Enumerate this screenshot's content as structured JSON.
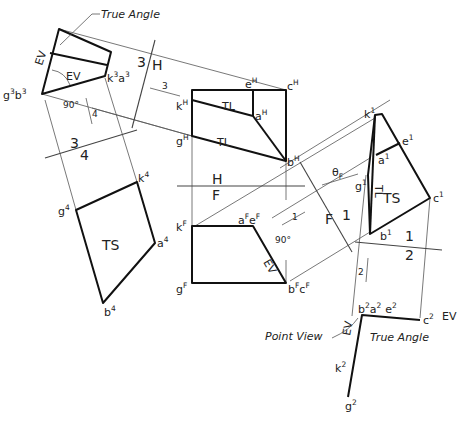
{
  "annotations": {
    "true_angle_top": "True Angle",
    "true_angle_bottom": "True Angle",
    "point_view": "Point View",
    "ev": "EV",
    "tl": "TL",
    "ts": "TS",
    "theta_f": "θ",
    "theta_f_sub": "F",
    "ninety": "90°"
  },
  "fold_lines": {
    "three_h": {
      "a": "3",
      "b": "H"
    },
    "three_four": {
      "a": "3",
      "b": "4"
    },
    "h_f": {
      "a": "H",
      "b": "F"
    },
    "f_one": {
      "a": "F",
      "b": "1"
    },
    "one_two": {
      "a": "1",
      "b": "2"
    }
  },
  "view_arrows": {
    "to_3": "3",
    "to_4": "4",
    "to_1": "1",
    "to_2": "2"
  },
  "points": {
    "view3": {
      "gb": [
        "g",
        "3",
        "b",
        "3"
      ],
      "ka": [
        "k",
        "3",
        "a",
        "3"
      ]
    },
    "view4": {
      "k": [
        "k",
        "4"
      ],
      "g": [
        "g",
        "4"
      ],
      "a": [
        "a",
        "4"
      ],
      "b": [
        "b",
        "4"
      ]
    },
    "viewH": {
      "e": [
        "e",
        "H"
      ],
      "c": [
        "c",
        "H"
      ],
      "k": [
        "k",
        "H"
      ],
      "a": [
        "a",
        "H"
      ],
      "g": [
        "g",
        "H"
      ],
      "b": [
        "b",
        "H"
      ]
    },
    "viewF": {
      "k": [
        "k",
        "F"
      ],
      "ae": [
        "a",
        "F",
        "e",
        "F"
      ],
      "g": [
        "g",
        "F"
      ],
      "bc": [
        "b",
        "F",
        "c",
        "F"
      ]
    },
    "view1": {
      "k": [
        "k",
        "1"
      ],
      "e": [
        "e",
        "1"
      ],
      "a": [
        "a",
        "1"
      ],
      "g": [
        "g",
        "1"
      ],
      "c": [
        "c",
        "1"
      ],
      "b": [
        "b",
        "1"
      ]
    },
    "view2": {
      "bae": [
        "b",
        "2",
        "a",
        "2",
        "e",
        "2"
      ],
      "c": [
        "c",
        "2"
      ],
      "k": [
        "k",
        "2"
      ],
      "g": [
        "g",
        "2"
      ]
    }
  }
}
